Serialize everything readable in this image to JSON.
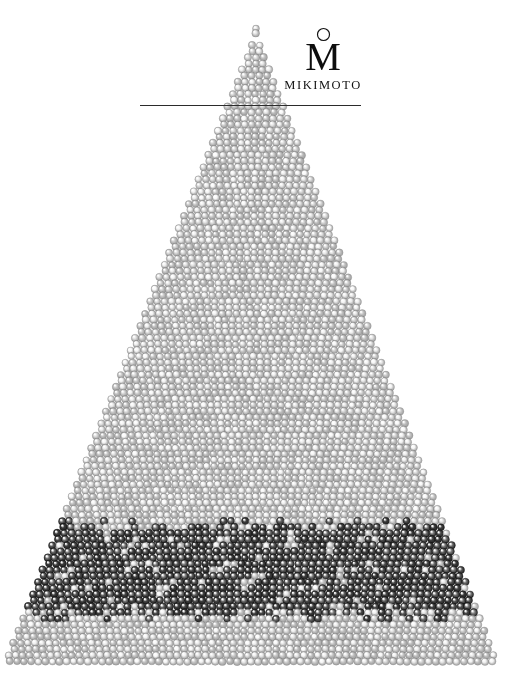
{
  "page": {
    "kind": "print-advertisement",
    "brand": "MIKIMOTO",
    "background_color": "#ffffff",
    "width": 515,
    "height": 687
  },
  "logo": {
    "monogram": "M",
    "wordmark": "MIKIMOTO",
    "pearl_mark_icon": "pearl-circle-icon",
    "ink_color": "#111111"
  },
  "rule": {
    "color": "#2b2b2b",
    "x": 140,
    "y": 105,
    "width": 221,
    "thickness": 1
  },
  "pyramid": {
    "description": "Triangular stack of pearls",
    "apex_x": 256,
    "apex_y": 27,
    "base_y": 663,
    "base_left_x": 2,
    "base_right_x": 500,
    "pearl_diameter": 7.6,
    "row_height": 6.1,
    "light_pearl_color": "#d8d8d8",
    "light_pearl_highlight": "#ffffff",
    "light_pearl_shadow": "#8e8e8e",
    "dark_pearl_color": "#2a2a2a",
    "dark_pearl_highlight": "#cfcfcf",
    "dark_pearl_shadow": "#070707",
    "bands": [
      {
        "name": "upper-white-pearls",
        "from_y": 27,
        "to_y": 524,
        "tone": "light"
      },
      {
        "name": "black-pearl-band",
        "from_y": 524,
        "to_y": 617,
        "tone": "dark"
      },
      {
        "name": "lower-white-pearls",
        "from_y": 617,
        "to_y": 663,
        "tone": "light"
      }
    ]
  }
}
